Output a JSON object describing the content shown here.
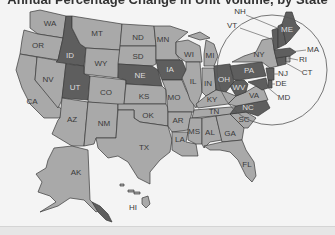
{
  "title": "Annual Percentage Change in Unit Volume, by State",
  "colors": {
    "background": "#f4f4f4",
    "light": "#a9a9a9",
    "medium": "#8a8a8a",
    "dark": "#5e5e5e",
    "border": "#3a3a3a"
  },
  "states": {
    "WA": "WA",
    "OR": "OR",
    "CA": "CA",
    "NV": "NV",
    "ID": "ID",
    "MT": "MT",
    "WY": "WY",
    "UT": "UT",
    "CO": "CO",
    "AZ": "AZ",
    "NM": "NM",
    "ND": "ND",
    "SD": "SD",
    "NE": "NE",
    "KS": "KS",
    "OK": "OK",
    "TX": "TX",
    "MN": "MN",
    "IA": "IA",
    "MO": "MO",
    "AR": "AR",
    "LA": "LA",
    "WI": "WI",
    "IL": "IL",
    "MI": "MI",
    "IN": "IN",
    "OH": "OH",
    "KY": "KY",
    "TN": "TN",
    "MS": "MS",
    "AL": "AL",
    "GA": "GA",
    "FL": "FL",
    "SC": "SC",
    "NC": "NC",
    "VA": "VA",
    "WV": "WV",
    "PA": "PA",
    "NY": "NY",
    "VT": "VT",
    "NH": "NH",
    "ME": "ME",
    "MA": "MA",
    "RI": "RI",
    "CT": "CT",
    "NJ": "NJ",
    "DE": "DE",
    "MD": "MD",
    "AK": "AK",
    "HI": "HI"
  },
  "shading": {
    "dark": [
      "ID",
      "UT",
      "NE",
      "IA",
      "OH",
      "PA",
      "WV",
      "NC",
      "ME",
      "NH",
      "VT",
      "MA",
      "CT",
      "NJ",
      "DE",
      "MD"
    ],
    "light": [
      "WA",
      "OR",
      "CA",
      "NV",
      "MT",
      "WY",
      "CO",
      "AZ",
      "NM",
      "ND",
      "SD",
      "KS",
      "OK",
      "TX",
      "MN",
      "MO",
      "AR",
      "LA",
      "WI",
      "IL",
      "MI",
      "IN",
      "KY",
      "TN",
      "MS",
      "AL",
      "GA",
      "FL",
      "SC",
      "VA",
      "NY",
      "RI",
      "AK",
      "HI"
    ]
  },
  "callout": {
    "description": "Northeast inset circle with leader lines",
    "labels": [
      "NH",
      "VT",
      "MA",
      "RI",
      "CT",
      "NJ",
      "DE",
      "MD"
    ]
  }
}
